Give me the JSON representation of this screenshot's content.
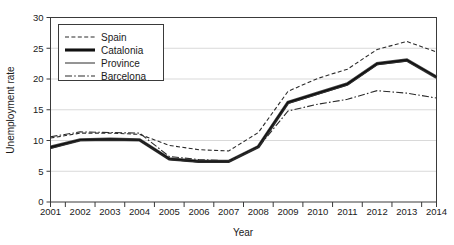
{
  "chart_data": {
    "type": "line",
    "title": "",
    "xlabel": "Year",
    "ylabel": "Unemployment rate",
    "categories": [
      "2001",
      "2002",
      "2003",
      "2004",
      "2005",
      "2006",
      "2007",
      "2008",
      "2009",
      "2010",
      "2011",
      "2012",
      "2013",
      "2014"
    ],
    "x": [
      2001,
      2002,
      2003,
      2004,
      2005,
      2006,
      2007,
      2008,
      2009,
      2010,
      2011,
      2012,
      2013,
      2014
    ],
    "ylim": [
      0,
      30
    ],
    "xlim": [
      2001,
      2014
    ],
    "yticks": [
      0,
      5,
      10,
      15,
      20,
      25,
      30
    ],
    "ytick_labels": [
      "0",
      "5",
      "10",
      "15",
      "20",
      "25",
      "30"
    ],
    "grid": true,
    "legend_position": "top-left",
    "series": [
      {
        "name": "Spain",
        "style": "dashed",
        "values": [
          10.4,
          11.2,
          11.2,
          11.0,
          9.2,
          8.5,
          8.3,
          11.3,
          18.0,
          20.1,
          21.6,
          24.8,
          26.1,
          24.4
        ]
      },
      {
        "name": "Catalonia",
        "style": "thick-solid",
        "values": [
          8.9,
          10.1,
          10.2,
          10.1,
          7.0,
          6.6,
          6.6,
          9.0,
          16.2,
          17.7,
          19.2,
          22.5,
          23.1,
          20.3
        ]
      },
      {
        "name": "Province",
        "style": "thin-solid",
        "values": [
          8.7,
          10.0,
          10.1,
          10.1,
          6.9,
          6.5,
          6.5,
          8.9,
          16.0,
          17.5,
          19.0,
          22.3,
          22.9,
          20.2
        ]
      },
      {
        "name": "Barcelona",
        "style": "dash-dot",
        "values": [
          10.6,
          11.4,
          11.3,
          11.2,
          7.4,
          6.9,
          6.7,
          8.9,
          14.8,
          15.9,
          16.7,
          18.1,
          17.7,
          16.9
        ]
      }
    ]
  },
  "legend": {
    "items": [
      {
        "label": "Spain"
      },
      {
        "label": "Catalonia"
      },
      {
        "label": "Province"
      },
      {
        "label": "Barcelona"
      }
    ]
  },
  "axes": {
    "y_title": "Unemployment rate",
    "x_title": "Year"
  },
  "colors": {
    "line": "#2b2b2b",
    "emphasis": "#111111",
    "grid": "#c9c9c9",
    "frame": "#3a3a3a",
    "background": "#ffffff"
  }
}
